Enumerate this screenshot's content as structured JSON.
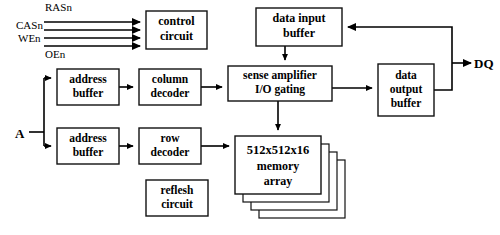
{
  "diagram": {
    "type": "block-diagram",
    "colors": {
      "background": "#ffffff",
      "line": "#000000",
      "box_fill": "#ffffff",
      "box_border": "#111111"
    },
    "blocks": [
      {
        "id": "control-circuit",
        "line1": "control",
        "line2": "circuit",
        "x": 146,
        "y": 11,
        "w": 61,
        "h": 38
      },
      {
        "id": "data-input-buffer",
        "line1": "data input",
        "line2": "buffer",
        "x": 256,
        "y": 8,
        "w": 86,
        "h": 38
      },
      {
        "id": "address-buffer-col",
        "line1": "address",
        "line2": "buffer",
        "x": 57,
        "y": 69,
        "w": 62,
        "h": 36
      },
      {
        "id": "column-decoder",
        "line1": "column",
        "line2": "decoder",
        "x": 139,
        "y": 69,
        "w": 62,
        "h": 36
      },
      {
        "id": "sense-amplifier",
        "line1": "sense amplifier",
        "line2": "I/O gating",
        "x": 228,
        "y": 66,
        "w": 104,
        "h": 35
      },
      {
        "id": "data-output-buffer",
        "line1": "data",
        "line2": "output",
        "line3": "buffer",
        "x": 378,
        "y": 64,
        "w": 56,
        "h": 52
      },
      {
        "id": "address-buffer-row",
        "line1": "address",
        "line2": "buffer",
        "x": 57,
        "y": 128,
        "w": 62,
        "h": 36
      },
      {
        "id": "row-decoder",
        "line1": "row",
        "line2": "decoder",
        "x": 139,
        "y": 128,
        "w": 62,
        "h": 36
      },
      {
        "id": "memory-array",
        "line1": "512x512x16",
        "line2": "memory",
        "line3": "array",
        "x": 235,
        "y": 136,
        "w": 86,
        "h": 58
      },
      {
        "id": "reflesh-circuit",
        "line1": "reflesh",
        "line2": "circuit",
        "x": 146,
        "y": 180,
        "w": 62,
        "h": 36
      }
    ],
    "signal_labels": [
      {
        "id": "rasn",
        "text": "RASn",
        "x": 45,
        "y": 11
      },
      {
        "id": "casn",
        "text": "CASn",
        "x": 16,
        "y": 24
      },
      {
        "id": "wen",
        "text": "WEn",
        "x": 18,
        "y": 37
      },
      {
        "id": "oen",
        "text": "OEn",
        "x": 45,
        "y": 50
      }
    ],
    "io_labels": [
      {
        "id": "address-input",
        "text": "A",
        "x": 17,
        "y": 133
      },
      {
        "id": "dq-bus",
        "text": "DQ",
        "x": 463,
        "y": 62
      }
    ],
    "memory_array_stack_count": 3
  }
}
